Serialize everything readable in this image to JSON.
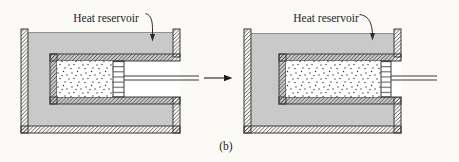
{
  "figure": {
    "left_panel": {
      "label": "Heat reservoir"
    },
    "right_panel": {
      "label": "Heat reservoir"
    },
    "caption": "(b)",
    "icons": {
      "transition_arrow": "right-arrow",
      "left_leader_arrow": "down-arrow-pointer",
      "right_leader_arrow": "down-arrow-pointer"
    }
  },
  "colors": {
    "background": "#fbfaf6",
    "reservoir_liquid": "#c9c9c9",
    "outline": "#3b3b3b",
    "text": "#1e1e1e"
  }
}
